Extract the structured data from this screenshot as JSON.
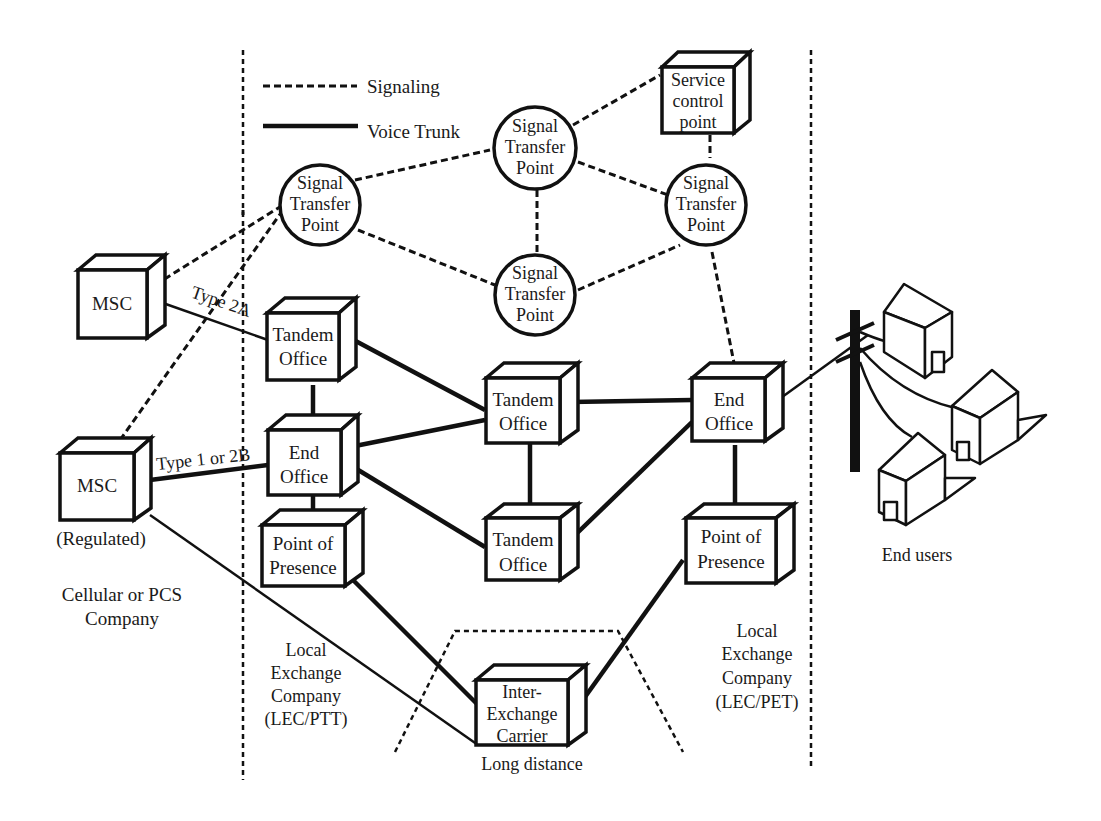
{
  "legend": {
    "signaling": "Signaling",
    "voice_trunk": "Voice Trunk"
  },
  "nodes": {
    "stp_left": [
      "Signal",
      "Transfer",
      "Point"
    ],
    "stp_top": [
      "Signal",
      "Transfer",
      "Point"
    ],
    "stp_mid": [
      "Signal",
      "Transfer",
      "Point"
    ],
    "stp_right": [
      "Signal",
      "Transfer",
      "Point"
    ],
    "scp": [
      "Service",
      "control",
      "point"
    ],
    "msc_top": [
      "MSC"
    ],
    "msc_bottom": [
      "MSC"
    ],
    "msc_bottom_caption": "(Regulated)",
    "lec_left_tandem": [
      "Tandem",
      "Office"
    ],
    "lec_left_end": [
      "End",
      "Office"
    ],
    "lec_left_pop": [
      "Point of",
      "Presence"
    ],
    "center_tandem_top": [
      "Tandem",
      "Office"
    ],
    "center_tandem_bottom": [
      "Tandem",
      "Office"
    ],
    "right_end_office": [
      "End",
      "Office"
    ],
    "right_pop": [
      "Point of",
      "Presence"
    ],
    "iec": [
      "Inter-",
      "Exchange",
      "Carrier"
    ]
  },
  "link_labels": {
    "type_2a": "Type 2A",
    "type_1_2b": "Type 1 or 2B"
  },
  "regions": {
    "cellular": [
      "Cellular or PCS",
      "Company"
    ],
    "lec_left": [
      "Local",
      "Exchange",
      "Company",
      "(LEC/PTT)"
    ],
    "lec_right": [
      "Local",
      "Exchange",
      "Company",
      "(LEC/PET)"
    ],
    "long_distance": "Long distance",
    "end_users": "End users"
  },
  "colors": {
    "ink": "#111111",
    "background": "#ffffff"
  }
}
